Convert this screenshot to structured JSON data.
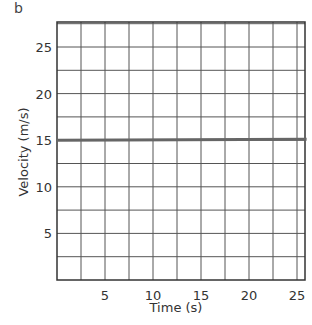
{
  "panel_label": "b",
  "chart_data": {
    "type": "line",
    "title": "",
    "xlabel": "Time (s)",
    "ylabel": "Velocity (m/s)",
    "xlim": [
      0,
      27
    ],
    "ylim": [
      0,
      27.5
    ],
    "x_ticks": [
      5,
      10,
      15,
      20,
      25
    ],
    "y_ticks": [
      5,
      10,
      15,
      20,
      25
    ],
    "grid": true,
    "grid_step": 2.5,
    "series": [
      {
        "name": "velocity",
        "x": [
          0,
          27
        ],
        "values": [
          15,
          15
        ]
      }
    ],
    "legend": null
  },
  "colors": {
    "grid": "#555555",
    "data_line": "#666666",
    "text": "#333333"
  }
}
